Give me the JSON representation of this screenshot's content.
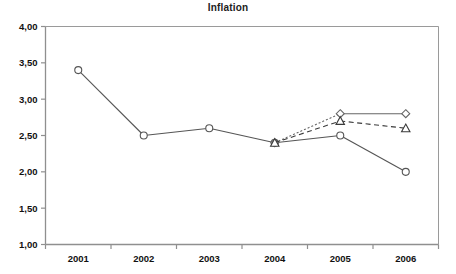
{
  "chart_data": {
    "type": "line",
    "title": "Inflation",
    "xlabel": "",
    "ylabel": "",
    "categories": [
      "2001",
      "2002",
      "2003",
      "2004",
      "2005",
      "2006"
    ],
    "ylim": [
      1.0,
      4.0
    ],
    "ytick_values": [
      1.0,
      1.5,
      2.0,
      2.5,
      3.0,
      3.5,
      4.0
    ],
    "ytick_labels": [
      "1,00",
      "1,50",
      "2,00",
      "2,50",
      "3,00",
      "3,50",
      "4,00"
    ],
    "grid": false,
    "legend": "none",
    "decimal_separator": ",",
    "series": [
      {
        "name": "actual",
        "marker": "circle",
        "line_style": "solid",
        "color": "#555555",
        "x": [
          "2001",
          "2002",
          "2003",
          "2004",
          "2005",
          "2006"
        ],
        "values": [
          3.4,
          2.5,
          2.6,
          2.4,
          2.5,
          2.0
        ]
      },
      {
        "name": "forecast-high",
        "marker": "diamond",
        "line_style": "dotted-then-solid",
        "color": "#666666",
        "x": [
          "2004",
          "2005",
          "2006"
        ],
        "values": [
          2.4,
          2.8,
          2.8
        ]
      },
      {
        "name": "forecast-mid",
        "marker": "triangle",
        "line_style": "dashed",
        "color": "#3a3a3a",
        "x": [
          "2004",
          "2005",
          "2006"
        ],
        "values": [
          2.4,
          2.7,
          2.6
        ]
      }
    ],
    "axis_color": "#8a8a8a",
    "frame_color": "#9a9a9a",
    "background": "#ffffff"
  }
}
